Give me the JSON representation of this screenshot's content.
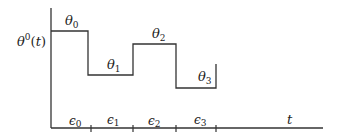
{
  "diagram": {
    "type": "step-function",
    "y_axis_label": {
      "base": "θ",
      "sup": "0",
      "arg": "(t)"
    },
    "x_axis_label": "t",
    "levels": [
      {
        "label_base": "θ",
        "label_sub": "0"
      },
      {
        "label_base": "θ",
        "label_sub": "1"
      },
      {
        "label_base": "θ",
        "label_sub": "2"
      },
      {
        "label_base": "θ",
        "label_sub": "3"
      }
    ],
    "intervals": [
      {
        "label_base": "ϵ",
        "label_sub": "0"
      },
      {
        "label_base": "ϵ",
        "label_sub": "1"
      },
      {
        "label_base": "ϵ",
        "label_sub": "2"
      },
      {
        "label_base": "ϵ",
        "label_sub": "3"
      }
    ],
    "line_color": "#333333"
  }
}
